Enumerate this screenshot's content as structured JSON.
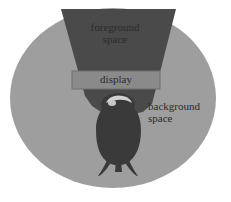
{
  "diagram": {
    "type": "schematic-diagram",
    "regions": [
      {
        "id": "background-space",
        "label": "background\nspace",
        "shape": "circle",
        "color": "#9e9e9e"
      },
      {
        "id": "foreground-space",
        "label": "foreground\nspace",
        "shape": "cone-trapezoid",
        "color": "#4a4a4a"
      },
      {
        "id": "display",
        "label": "display",
        "shape": "rectangle",
        "color": "#8a8a8a"
      }
    ],
    "actor": {
      "id": "person",
      "label": "person",
      "shape": "overhead-silhouette",
      "color": "#3d3d3d"
    }
  },
  "labels": {
    "foreground_line1": "foreground",
    "foreground_line2": "space",
    "display": "display",
    "background_line1": "background",
    "background_line2": "space"
  },
  "colors": {
    "page_background": "#ffffff",
    "circle_fill": "#9e9e9e",
    "cone_fill": "#4a4a4a",
    "display_fill": "#8a8a8a",
    "display_border": "#6f6f6f",
    "person_fill": "#3a3a3a",
    "person_head_highlight": "#d6d6d6",
    "label_text": "#2b2b2b"
  },
  "geometry": {
    "canvas_width": 231,
    "canvas_height": 202,
    "circle_center_x": 113,
    "circle_center_y": 98,
    "circle_radius_x": 103,
    "circle_radius_y": 90,
    "display_rect": {
      "x": 72,
      "y": 71,
      "width": 88,
      "height": 18
    }
  }
}
